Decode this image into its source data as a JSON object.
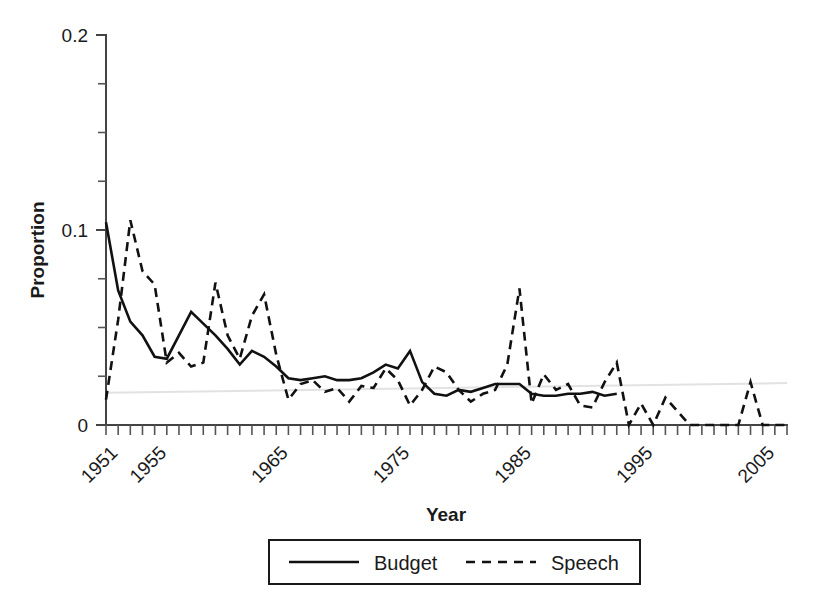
{
  "chart_data": {
    "type": "line",
    "title": "",
    "xlabel": "Year",
    "ylabel": "Proportion",
    "xlim": [
      1951,
      2007
    ],
    "ylim": [
      0,
      0.2
    ],
    "grid": false,
    "legend_position": "bottom-center",
    "y_ticks_major": [
      0,
      0.1,
      0.2
    ],
    "y_tick_labels": [
      "0",
      "0.1",
      "0.2"
    ],
    "y_ticks_minor": [
      0.025,
      0.05,
      0.075,
      0.125,
      0.15,
      0.175
    ],
    "x_tick_labels": [
      "1951",
      "1955",
      "1965",
      "1975",
      "1985",
      "1995",
      "2005"
    ],
    "x_tick_label_values": [
      1951,
      1955,
      1965,
      1975,
      1985,
      1995,
      2005
    ],
    "x_tick_label_rotation": -45,
    "x_ticks_all_years": true,
    "annotations": [
      {
        "name": "faint-trend-line",
        "type": "linear",
        "x0": 1951,
        "y0": 0.0165,
        "x1": 2007,
        "y1": 0.0215,
        "color": "#e2e2e2"
      }
    ],
    "x": [
      1951,
      1952,
      1953,
      1954,
      1955,
      1956,
      1957,
      1958,
      1959,
      1960,
      1961,
      1962,
      1963,
      1964,
      1965,
      1966,
      1967,
      1968,
      1969,
      1970,
      1971,
      1972,
      1973,
      1974,
      1975,
      1976,
      1977,
      1978,
      1979,
      1980,
      1981,
      1982,
      1983,
      1984,
      1985,
      1986,
      1987,
      1988,
      1989,
      1990,
      1991,
      1992,
      1993,
      1994,
      1995,
      1996,
      1997,
      1998,
      1999,
      2000,
      2001,
      2002,
      2003,
      2004,
      2005,
      2006,
      2007
    ],
    "series": [
      {
        "name": "Budget",
        "style": "solid",
        "color": "#111111",
        "x": [
          1951,
          1952,
          1953,
          1954,
          1955,
          1956,
          1957,
          1958,
          1959,
          1960,
          1961,
          1962,
          1963,
          1964,
          1965,
          1966,
          1967,
          1968,
          1969,
          1970,
          1971,
          1972,
          1973,
          1974,
          1975,
          1976,
          1977,
          1978,
          1979,
          1980,
          1981,
          1982,
          1983,
          1984,
          1985,
          1986,
          1987,
          1988,
          1989,
          1990,
          1991,
          1992,
          1993
        ],
        "values": [
          0.104,
          0.069,
          0.053,
          0.046,
          0.035,
          0.034,
          0.046,
          0.058,
          0.052,
          0.046,
          0.039,
          0.031,
          0.038,
          0.035,
          0.03,
          0.024,
          0.023,
          0.024,
          0.025,
          0.023,
          0.023,
          0.024,
          0.027,
          0.031,
          0.029,
          0.038,
          0.022,
          0.016,
          0.015,
          0.018,
          0.017,
          0.019,
          0.021,
          0.021,
          0.021,
          0.016,
          0.015,
          0.015,
          0.016,
          0.016,
          0.017,
          0.015,
          0.016
        ]
      },
      {
        "name": "Speech",
        "style": "dashed",
        "color": "#111111",
        "x": [
          1951,
          1952,
          1953,
          1954,
          1955,
          1956,
          1957,
          1958,
          1959,
          1960,
          1961,
          1962,
          1963,
          1964,
          1965,
          1966,
          1967,
          1968,
          1969,
          1970,
          1971,
          1972,
          1973,
          1974,
          1975,
          1976,
          1977,
          1978,
          1979,
          1980,
          1981,
          1982,
          1983,
          1984,
          1985,
          1986,
          1987,
          1988,
          1989,
          1990,
          1991,
          1992,
          1993,
          1994,
          1995,
          1996,
          1997,
          1998,
          1999,
          2000,
          2001,
          2002,
          2003,
          2004,
          2005,
          2006,
          2007
        ],
        "values": [
          0.013,
          0.054,
          0.105,
          0.079,
          0.072,
          0.032,
          0.037,
          0.03,
          0.032,
          0.073,
          0.046,
          0.034,
          0.056,
          0.067,
          0.036,
          0.013,
          0.021,
          0.023,
          0.017,
          0.019,
          0.012,
          0.02,
          0.019,
          0.029,
          0.023,
          0.01,
          0.018,
          0.03,
          0.027,
          0.018,
          0.012,
          0.016,
          0.018,
          0.031,
          0.07,
          0.011,
          0.026,
          0.018,
          0.021,
          0.01,
          0.009,
          0.022,
          0.032,
          0.0,
          0.011,
          0.0,
          0.014,
          0.007,
          0.0,
          0.0,
          0.0,
          0.0,
          0.0,
          0.022,
          0.0,
          0.0,
          0.0
        ]
      }
    ]
  },
  "legend": {
    "items": [
      {
        "label": "Budget",
        "style": "solid"
      },
      {
        "label": "Speech",
        "style": "dashed"
      }
    ]
  },
  "axes": {
    "y_title": "Proportion",
    "x_title": "Year"
  }
}
